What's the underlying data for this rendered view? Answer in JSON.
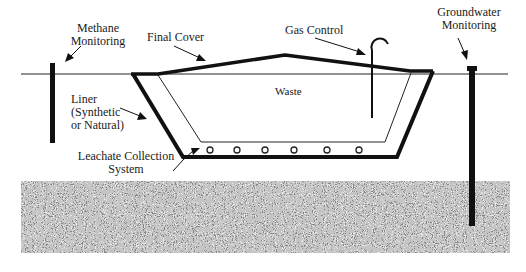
{
  "diagram": {
    "colors": {
      "line": "#111111",
      "background": "#ffffff",
      "soil_dark": "#2a2a2a",
      "soil_light": "#d8d8d8"
    },
    "labels": {
      "methane_line1": "Methane",
      "methane_line2": "Monitoring",
      "final_cover": "Final Cover",
      "gas_control": "Gas Control",
      "groundwater_line1": "Groundwater",
      "groundwater_line2": "Monitoring",
      "waste": "Waste",
      "liner_line1": "Liner",
      "liner_line2": "(Synthetic",
      "liner_line3": "or Natural)",
      "leachate_line1": "Leachate Collection",
      "leachate_line2": "System"
    },
    "components": [
      {
        "id": "methane-monitoring-well",
        "icon": "vertical-pole"
      },
      {
        "id": "final-cover",
        "icon": "thick-line"
      },
      {
        "id": "gas-control-vent",
        "icon": "hooked-pipe"
      },
      {
        "id": "groundwater-monitoring-well",
        "icon": "vertical-pole"
      },
      {
        "id": "liner",
        "icon": "thick-outline"
      },
      {
        "id": "leachate-collection-pipes",
        "icon": "circles",
        "count": 6
      },
      {
        "id": "ground-soil",
        "icon": "noise-texture"
      }
    ]
  }
}
